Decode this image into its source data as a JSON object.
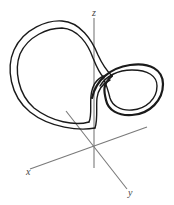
{
  "figure": {
    "axes": {
      "x_label": "x",
      "y_label": "y",
      "z_label": "z"
    },
    "colors": {
      "axis": "#7a7a7a",
      "curve": "#1a1a1a",
      "label": "#444444",
      "background": "#ffffff"
    }
  }
}
